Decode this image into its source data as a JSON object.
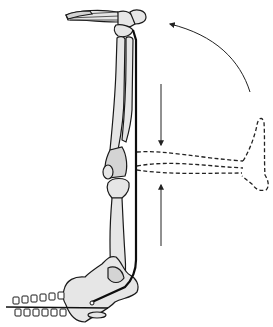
{
  "figure": {
    "colors": {
      "background": "#ffffff",
      "bone_fill": "#e6e6e6",
      "bone_shade": "#d4d4d4",
      "outline": "#1a1a1a"
    },
    "elements": {
      "foot": "foot-bones",
      "upper_limb": "tibia-fibula",
      "knee": "knee-joint",
      "lower_limb": "femur",
      "pelvis": "pelvis",
      "spine": "vertebrae",
      "tendon": "tendon-line",
      "dashed_limb": "flexed-limb-outline",
      "arrows": [
        "curved-arrow-rotation",
        "down-arrow",
        "up-arrow"
      ]
    },
    "caption": ""
  }
}
